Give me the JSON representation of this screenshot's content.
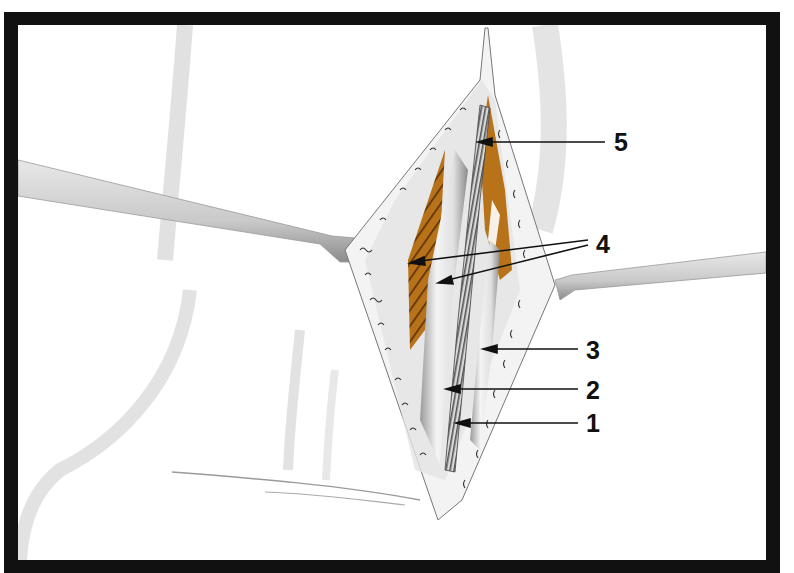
{
  "figure": {
    "type": "anatomical-illustration",
    "colors": {
      "frame": "#111111",
      "background": "#ffffff",
      "muscle": "#b8731a",
      "muscle_hatch": "#5a2e08",
      "skin_shadow": "#c8c8c8",
      "vessel": "#e6e6e6",
      "trachea_ring": "#6b6b6b"
    }
  },
  "labels": [
    {
      "id": "1",
      "text": "1",
      "x": 586,
      "y": 423
    },
    {
      "id": "2",
      "text": "2",
      "x": 586,
      "y": 390
    },
    {
      "id": "3",
      "text": "3",
      "x": 586,
      "y": 350
    },
    {
      "id": "4",
      "text": "4",
      "x": 596,
      "y": 244
    },
    {
      "id": "5",
      "text": "5",
      "x": 614,
      "y": 142
    }
  ],
  "structures": [
    {
      "name": "left-retractor"
    },
    {
      "name": "right-retractor"
    },
    {
      "name": "incision"
    },
    {
      "name": "muscle-left-hatched"
    },
    {
      "name": "muscle-right"
    },
    {
      "name": "trachea"
    },
    {
      "name": "vessel-left"
    },
    {
      "name": "vessel-right"
    }
  ]
}
